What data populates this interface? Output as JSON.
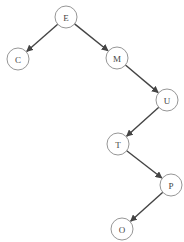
{
  "diagram": {
    "type": "binary-tree",
    "node_radius": 11,
    "colors": {
      "edge": "#444444",
      "node_stroke": "#8a8a8a",
      "node_fill": "#ffffff",
      "label": "#444444",
      "background": "#ffffff"
    },
    "nodes": [
      {
        "id": "E",
        "label": "E",
        "x": 66,
        "y": 17
      },
      {
        "id": "C",
        "label": "C",
        "x": 18,
        "y": 59
      },
      {
        "id": "M",
        "label": "M",
        "x": 117,
        "y": 58
      },
      {
        "id": "U",
        "label": "U",
        "x": 167,
        "y": 100
      },
      {
        "id": "T",
        "label": "T",
        "x": 118,
        "y": 144
      },
      {
        "id": "P",
        "label": "P",
        "x": 171,
        "y": 185
      },
      {
        "id": "O",
        "label": "O",
        "x": 122,
        "y": 229
      }
    ],
    "edges": [
      {
        "from": "E",
        "to": "C",
        "side": "left"
      },
      {
        "from": "E",
        "to": "M",
        "side": "right"
      },
      {
        "from": "M",
        "to": "U",
        "side": "right"
      },
      {
        "from": "U",
        "to": "T",
        "side": "left"
      },
      {
        "from": "T",
        "to": "P",
        "side": "right"
      },
      {
        "from": "P",
        "to": "O",
        "side": "left"
      }
    ]
  }
}
